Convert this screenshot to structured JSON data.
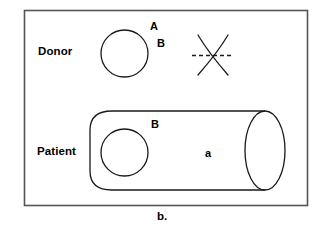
{
  "figure": {
    "caption": "b.",
    "border_color": "#555555",
    "stroke_color": "#1a1a1a",
    "background": "#ffffff",
    "rows": [
      {
        "label": "Donor"
      },
      {
        "label": "Patient"
      }
    ],
    "donor": {
      "row_label": "Donor",
      "cell_shape": "circle",
      "antigen_labels": [
        "A",
        "B"
      ],
      "incompatibility_marker": "crossed-out-x"
    },
    "patient": {
      "row_label": "Patient",
      "vessel_shape": "cylinder",
      "cell_shape": "circle",
      "antigen_label": "B",
      "antibody_label": "a"
    }
  }
}
